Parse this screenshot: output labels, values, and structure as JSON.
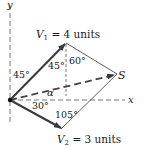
{
  "diagram": {
    "axes": {
      "x_label": "x",
      "y_label": "y"
    },
    "vectors": {
      "v1": {
        "name": "V",
        "sub": "1",
        "eq": " = 4 units"
      },
      "v2": {
        "name": "V",
        "sub": "2",
        "eq": " = 3 units"
      },
      "s": {
        "name": "S"
      }
    },
    "angles": {
      "v1_from_y": "45°",
      "v1_inner": "45°",
      "top": "60°",
      "alpha": "α",
      "v2_from_x": "30°",
      "bottom": "105°"
    },
    "colors": {
      "vector": "#444444",
      "line": "#333333",
      "dash": "#555555"
    }
  }
}
